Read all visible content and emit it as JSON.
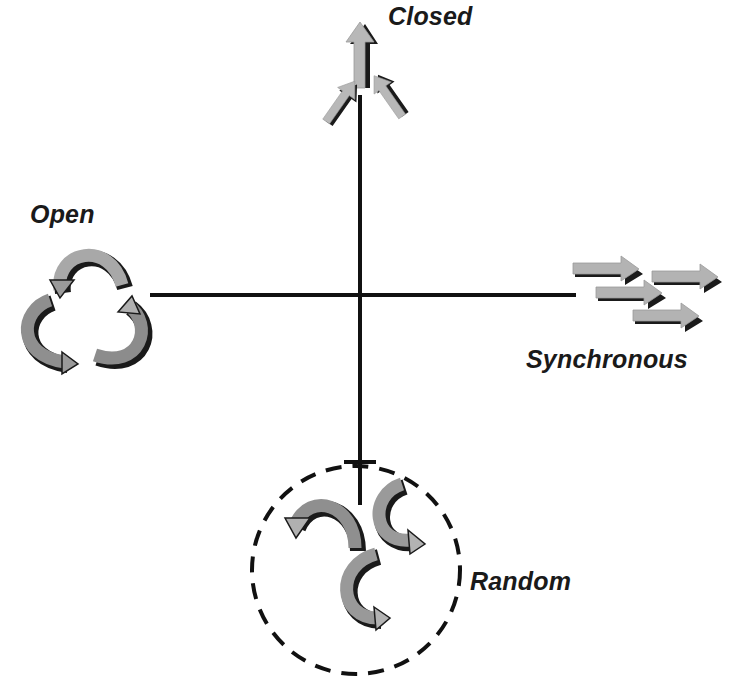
{
  "diagram": {
    "title": "",
    "axes": {
      "horizontal": {
        "from": [
          150,
          295
        ],
        "to": [
          576,
          295
        ]
      },
      "vertical": {
        "from": [
          360,
          95
        ],
        "to": [
          360,
          505
        ]
      }
    },
    "quadrant_labels": [
      {
        "id": "closed",
        "text": "Closed",
        "position": "top",
        "x": 388,
        "y": 2
      },
      {
        "id": "open",
        "text": "Open",
        "position": "left",
        "x": 30,
        "y": 200
      },
      {
        "id": "synchronous",
        "text": "Synchronous",
        "position": "right",
        "x": 526,
        "y": 345
      },
      {
        "id": "random",
        "text": "Random",
        "position": "bottom",
        "x": 470,
        "y": 567
      }
    ],
    "icons": [
      {
        "id": "closed",
        "name": "converging-up-arrows-icon",
        "arrow_count": 3
      },
      {
        "id": "open",
        "name": "cyclic-arrows-icon",
        "arrow_count": 3
      },
      {
        "id": "synchronous",
        "name": "parallel-right-arrows-icon",
        "arrow_count": 4
      },
      {
        "id": "random",
        "name": "random-curved-arrows-icon",
        "arrow_count": 3,
        "enclosure": "dashed-circle"
      }
    ],
    "colors": {
      "axis": "#111111",
      "arrow_fill_light": "#b3b3b3",
      "arrow_fill_dark": "#8c8c8c",
      "arrow_shadow": "#1a1a1a",
      "text": "#1a1a1a",
      "background": "#ffffff"
    }
  }
}
